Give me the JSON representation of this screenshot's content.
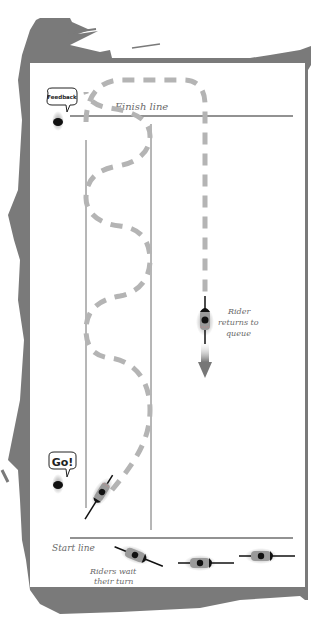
{
  "diagram": {
    "labels": {
      "finish_line": "Finish line",
      "start_line": "Start line",
      "feedback_bubble": "Feedback",
      "go_bubble": "Go!",
      "rider_returns_line1": "Rider",
      "rider_returns_line2": "returns to",
      "rider_returns_line3": "queue",
      "riders_wait_line1": "Riders wait",
      "riders_wait_line2": "their turn"
    },
    "colors": {
      "frame": "#7a7a7a",
      "panel": "#ffffff",
      "lines": "#6e6e6e",
      "dash_path": "#b4b4b4",
      "rider_body": "#9a9a9a",
      "rider_dark": "#111111",
      "text": "#6a6a6a"
    },
    "elements": {
      "coach_feedback": {
        "x": 58,
        "y": 124
      },
      "coach_go": {
        "x": 58,
        "y": 484
      },
      "riders_in_queue": 3,
      "active_rider": {
        "x": 102,
        "y": 492,
        "heading": "up-right"
      },
      "returning_rider": {
        "x": 205,
        "y": 322,
        "heading": "down"
      }
    }
  }
}
